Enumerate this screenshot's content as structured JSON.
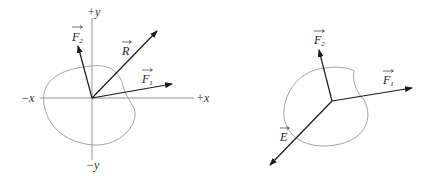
{
  "diagrams": [
    {
      "name": "forces-with-resultant",
      "axes": {
        "pos_x": "+x",
        "neg_x": "−x",
        "pos_y": "+y",
        "neg_y": "−y"
      },
      "vectors": [
        {
          "id": "F1",
          "label": "F",
          "sub": "1"
        },
        {
          "id": "F2",
          "label": "F",
          "sub": "2"
        },
        {
          "id": "R",
          "label": "R",
          "sub": ""
        }
      ]
    },
    {
      "name": "forces-with-equilibrant",
      "vectors": [
        {
          "id": "F1",
          "label": "F",
          "sub": "1"
        },
        {
          "id": "F2",
          "label": "F",
          "sub": "2"
        },
        {
          "id": "E",
          "label": "E",
          "sub": ""
        }
      ]
    }
  ],
  "colors": {
    "vector": "#1a1a1a",
    "axis": "#8a8a8a",
    "outline": "#9a9a9a",
    "background": "#ffffff"
  }
}
